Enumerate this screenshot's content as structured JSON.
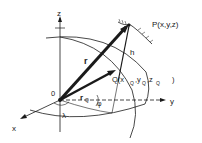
{
  "diagram": {
    "labels": {
      "z_axis": "z",
      "y_axis": "y",
      "x_axis": "x",
      "origin": "0",
      "point_p": "P(x,y,z)",
      "point_q": "Q(x",
      "q_sub_x": "Q",
      "q_comma1": ",y",
      "q_sub_y": "Q",
      "q_comma2": ",z",
      "q_sub_z": "Q",
      "q_close": ")",
      "vector_r": "r",
      "vector_rq": "r",
      "rq_sub": "Q",
      "height_h": "h",
      "longitude": "λ",
      "latitude": "φ"
    },
    "colors": {
      "stroke": "#1a1a1a",
      "background": "#ffffff"
    }
  }
}
